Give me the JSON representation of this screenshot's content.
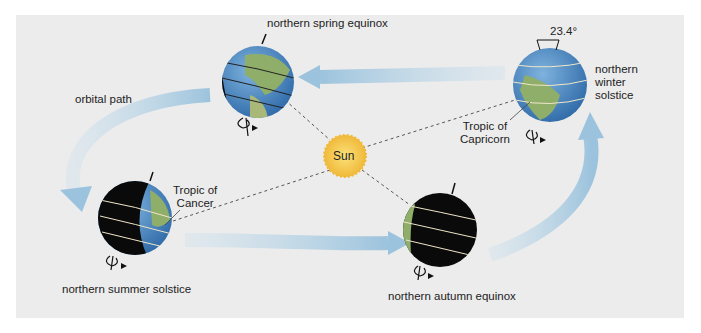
{
  "diagram": {
    "labels": {
      "spring": "northern spring equinox",
      "winter_line1": "northern",
      "winter_line2": "winter",
      "winter_line3": "solstice",
      "summer": "northern summer solstice",
      "autumn": "northern autumn equinox",
      "orbital_path": "orbital path",
      "sun": "Sun",
      "tilt": "23.4°",
      "tropic_cancer_line1": "Tropic of",
      "tropic_cancer_line2": "Cancer",
      "tropic_capricorn_line1": "Tropic of",
      "tropic_capricorn_line2": "Capricorn"
    },
    "colors": {
      "background_panel": "#ececec",
      "arrow": "#a9cce3",
      "sun": "#f4c842",
      "ocean": "#4a86c5",
      "land": "#8fae6a",
      "night": "#0a0a0a",
      "latitude_lines": "#f0e6c8"
    }
  }
}
